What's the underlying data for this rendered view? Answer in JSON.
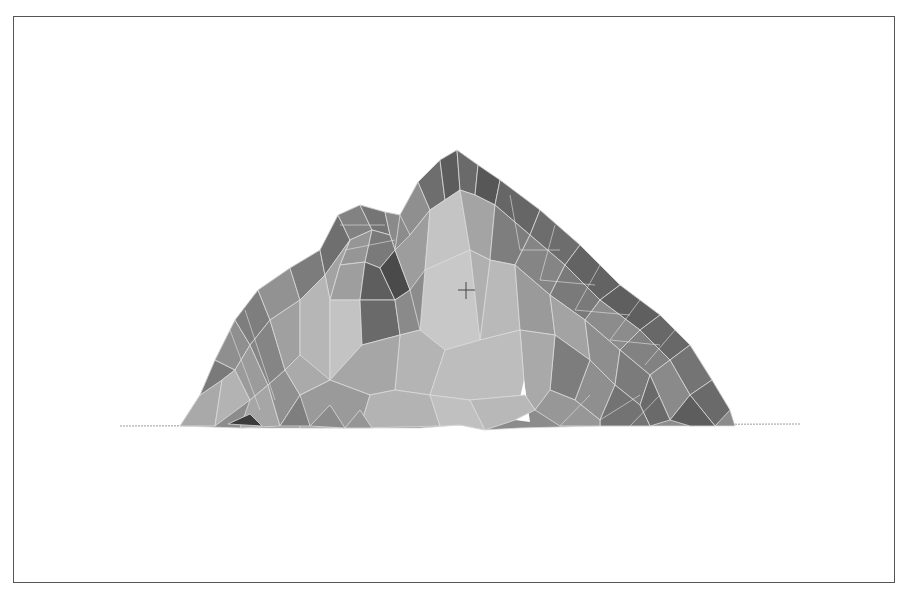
{
  "scene": {
    "subject": "3D triangulated terrain mesh of a mountain",
    "render_style": "flat-shaded grayscale with light wireframe edges",
    "colors": {
      "frame": "#555555",
      "background": "#ffffff",
      "wire": "#d8d8d8",
      "ground_line": "#9a9a9a",
      "cursor": "#444444"
    },
    "cursor": {
      "type": "crosshair",
      "x": 466,
      "y": 290
    },
    "ground_line": {
      "x1": 120,
      "x2": 800,
      "y": 426
    }
  }
}
